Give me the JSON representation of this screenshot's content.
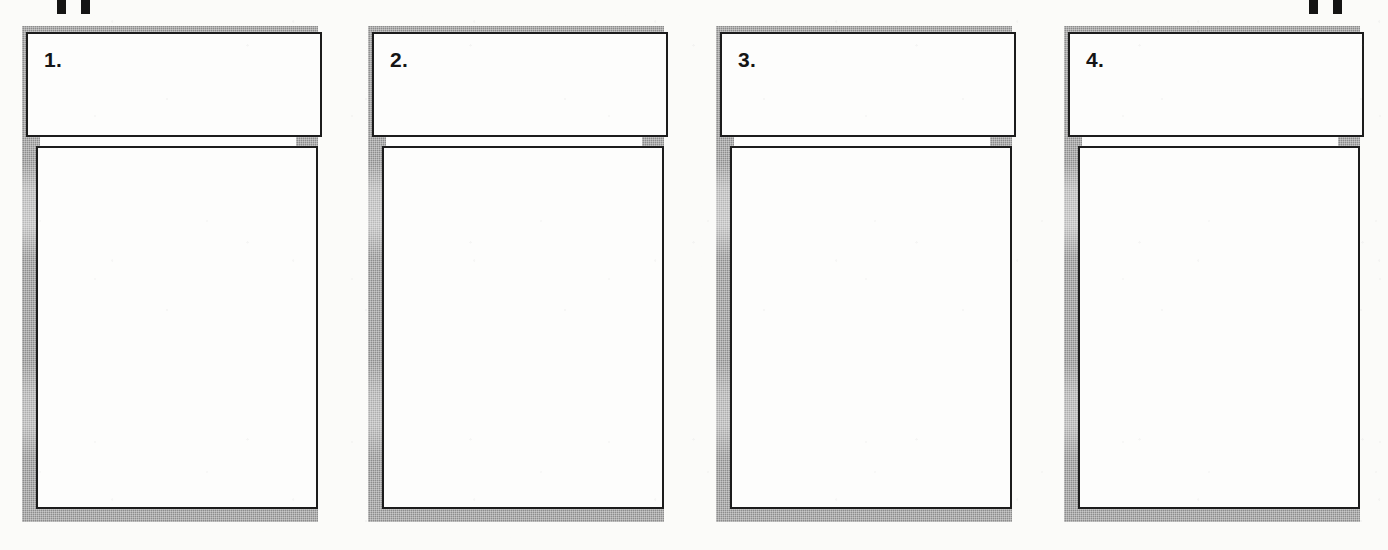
{
  "document": {
    "type": "scanned-worksheet-template",
    "title": "Numbered Panel Worksheet",
    "panel_count": 4,
    "orientation": "landscape",
    "background_color": "#fbfbf9",
    "border_color": "#8c8c8c",
    "ink_color": "#1c1c1c",
    "box_fill_color": "#fdfdfc"
  },
  "crop_marks": [
    {
      "name": "crop-mark-top-left-a",
      "x": 57,
      "label": ""
    },
    {
      "name": "crop-mark-top-left-b",
      "x": 81,
      "label": ""
    },
    {
      "name": "crop-mark-top-right-a",
      "x": 1309,
      "label": ""
    },
    {
      "name": "crop-mark-top-right-b",
      "x": 1333,
      "label": ""
    }
  ],
  "panels": [
    {
      "number": "1.",
      "x": 0,
      "title_text": "",
      "body_text": ""
    },
    {
      "number": "2.",
      "x": 346,
      "title_text": "",
      "body_text": ""
    },
    {
      "number": "3.",
      "x": 694,
      "title_text": "",
      "body_text": ""
    },
    {
      "number": "4.",
      "x": 1042,
      "title_text": "",
      "body_text": ""
    }
  ]
}
